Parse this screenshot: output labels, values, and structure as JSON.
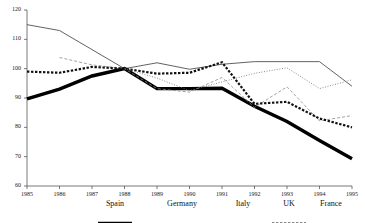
{
  "chart_data": {
    "type": "line",
    "title": "",
    "xlabel": "",
    "ylabel": "",
    "x": [
      1985,
      1986,
      1987,
      1988,
      1989,
      1990,
      1991,
      1992,
      1993,
      1994,
      1995
    ],
    "xtick_labels": [
      "1985",
      "1986",
      "1987",
      "1988",
      "1989",
      "1990",
      "1991",
      "1992",
      "1993",
      "1994",
      "1995"
    ],
    "ytick_labels": [
      "60",
      "70",
      "80",
      "90",
      "100",
      "110",
      "120"
    ],
    "yticks": [
      60,
      70,
      80,
      90,
      100,
      110,
      120
    ],
    "ylim": [
      60,
      120
    ],
    "xlim": [
      1985,
      1995
    ],
    "grid": false,
    "legend_position": "bottom",
    "series": [
      {
        "name": "Spain",
        "style": "thick-solid",
        "color": "#000000",
        "values": [
          89.7,
          93.0,
          97.5,
          100.0,
          93.2,
          93.2,
          93.3,
          87.2,
          82.0,
          75.5,
          69.3
        ]
      },
      {
        "name": "Germany",
        "style": "thin-solid",
        "color": "#3a3a3a",
        "values": [
          115.0,
          113.0,
          106.5,
          100.0,
          102.0,
          99.8,
          101.5,
          102.4,
          102.4,
          102.4,
          94.0
        ]
      },
      {
        "name": "Italy",
        "style": "thin-dashed",
        "color": "#8a8a8a",
        "values": [
          null,
          103.8,
          101.3,
          100.0,
          93.2,
          92.0,
          97.0,
          86.8,
          93.8,
          82.2,
          84.0
        ]
      },
      {
        "name": "UK",
        "style": "thick-dotted",
        "color": "#111111",
        "values": [
          99.0,
          98.6,
          100.6,
          100.0,
          98.3,
          98.6,
          102.2,
          88.0,
          88.7,
          83.0,
          80.0
        ]
      },
      {
        "name": "France",
        "style": "fine-dotted",
        "color": "#6e6e6e",
        "values": [
          null,
          null,
          null,
          100.0,
          96.8,
          92.5,
          95.5,
          98.4,
          100.3,
          93.2,
          96.2
        ]
      }
    ]
  },
  "legend": {
    "items": [
      {
        "label": "Spain"
      },
      {
        "label": "Germany"
      },
      {
        "label": "Italy"
      },
      {
        "label": "UK"
      },
      {
        "label": "France"
      }
    ]
  }
}
